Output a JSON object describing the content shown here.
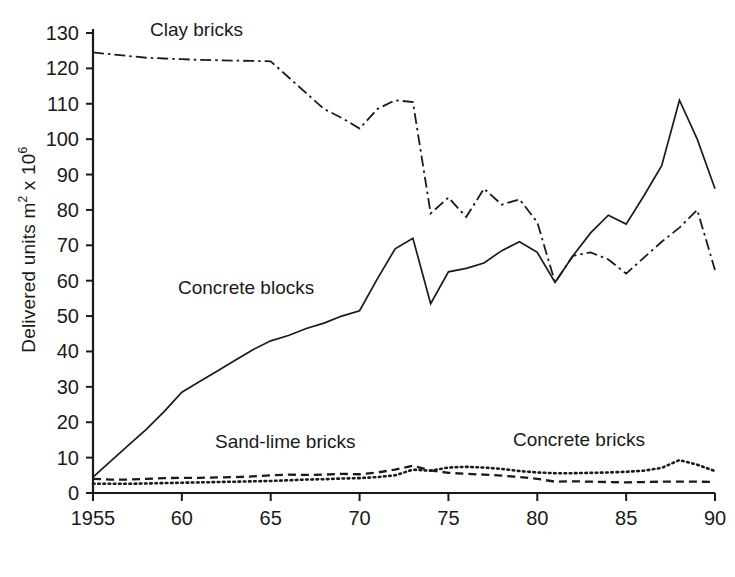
{
  "chart_data": {
    "type": "line",
    "title": "",
    "xlabel": "",
    "ylabel": "Delivered units m2 x 106",
    "ylabel_parts": {
      "main": "Delivered units m",
      "sup1": "2",
      "mid": " x 10",
      "sup2": "6"
    },
    "xlim": [
      1955,
      1990
    ],
    "ylim": [
      0,
      130
    ],
    "grid": false,
    "legend_position": "inline-annotations",
    "y_ticks": [
      0,
      10,
      20,
      30,
      40,
      50,
      60,
      70,
      80,
      90,
      100,
      110,
      120,
      130
    ],
    "y_tick_labels": [
      "0",
      "10",
      "20",
      "30",
      "40",
      "50",
      "60",
      "70",
      "80",
      "90",
      "100",
      "110",
      "120",
      "130"
    ],
    "x_ticks": [
      1955,
      1960,
      1965,
      1970,
      1975,
      1980,
      1985,
      1990
    ],
    "x_tick_labels": [
      "1955",
      "60",
      "65",
      "70",
      "75",
      "80",
      "85",
      "90"
    ],
    "x": [
      1955,
      1956,
      1957,
      1958,
      1959,
      1960,
      1961,
      1962,
      1963,
      1964,
      1965,
      1966,
      1967,
      1968,
      1969,
      1970,
      1971,
      1972,
      1973,
      1974,
      1975,
      1976,
      1977,
      1978,
      1979,
      1980,
      1981,
      1982,
      1983,
      1984,
      1985,
      1986,
      1987,
      1988,
      1989,
      1990
    ],
    "series": [
      {
        "name": "Clay bricks",
        "style": "dash-dot",
        "color": "#1a1a1a",
        "annotation": "Clay bricks",
        "values": [
          124.5,
          124.0,
          123.5,
          123.0,
          122.8,
          122.6,
          122.4,
          122.3,
          122.2,
          122.1,
          122.0,
          117.5,
          113.0,
          108.5,
          106.0,
          103.0,
          108.5,
          111.0,
          110.5,
          79.0,
          83.5,
          78.0,
          86.0,
          81.5,
          83.0,
          76.5,
          59.5,
          67.0,
          68.0,
          66.0,
          62.0,
          66.5,
          71.0,
          75.0,
          80.0,
          63.0
        ]
      },
      {
        "name": "Concrete blocks",
        "style": "solid",
        "color": "#1a1a1a",
        "annotation": "Concrete blocks",
        "values": [
          4.5,
          9.0,
          13.5,
          18.0,
          23.0,
          28.5,
          31.5,
          34.5,
          37.5,
          40.5,
          43.0,
          44.5,
          46.5,
          48.0,
          50.0,
          51.5,
          60.5,
          69.0,
          72.0,
          53.5,
          62.5,
          63.5,
          65.0,
          68.5,
          71.0,
          68.0,
          59.5,
          67.0,
          73.5,
          78.5,
          76.0,
          84.0,
          92.5,
          111.0,
          100.0,
          86.0
        ]
      },
      {
        "name": "Sand-lime bricks",
        "style": "dashed",
        "color": "#1a1a1a",
        "annotation": "Sand-lime bricks",
        "values": [
          4.0,
          3.8,
          3.8,
          4.0,
          4.2,
          4.3,
          4.3,
          4.4,
          4.5,
          4.7,
          5.0,
          5.2,
          5.1,
          5.2,
          5.4,
          5.3,
          5.8,
          6.6,
          7.7,
          6.4,
          5.7,
          5.4,
          5.2,
          4.9,
          4.5,
          4.0,
          3.2,
          3.3,
          3.2,
          3.1,
          3.0,
          3.1,
          3.2,
          3.2,
          3.2,
          3.1
        ]
      },
      {
        "name": "Concrete bricks",
        "style": "dotted",
        "color": "#1a1a1a",
        "annotation": "Concrete bricks",
        "values": [
          2.6,
          2.6,
          2.6,
          2.7,
          2.8,
          2.9,
          3.0,
          3.1,
          3.2,
          3.3,
          3.4,
          3.6,
          3.8,
          3.9,
          4.1,
          4.2,
          4.5,
          5.0,
          6.6,
          6.3,
          7.2,
          7.4,
          7.2,
          6.8,
          6.2,
          5.8,
          5.6,
          5.6,
          5.7,
          5.8,
          6.0,
          6.3,
          7.1,
          9.3,
          8.0,
          6.2
        ]
      }
    ]
  },
  "axis": {
    "y_label_main": "Delivered units m",
    "y_label_sup1": "2",
    "y_label_mid": " x 10",
    "y_label_sup2": "6"
  }
}
